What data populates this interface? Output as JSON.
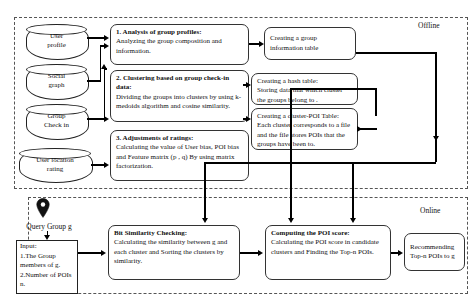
{
  "figure": {
    "offline_label": "Offline",
    "online_label": "Online"
  },
  "data_sources": [
    {
      "id": "user-profile",
      "line1": "User",
      "line2": "profile"
    },
    {
      "id": "social-graph",
      "line1": "Social",
      "line2": "graph"
    },
    {
      "id": "group-checkin",
      "line1": "Group",
      "line2": "Check in"
    },
    {
      "id": "user-location-rating",
      "line1": "User location",
      "line2": "rating"
    }
  ],
  "offline_steps": [
    {
      "id": "analysis",
      "heading": "1. Analysis of group profiles:",
      "body": "Analyzing the group composition and information."
    },
    {
      "id": "clustering",
      "heading": "2. Clustering based on group check-in data:",
      "body": "Dividing the groups into clusters by using k-medoids algorithm and cosine similarity."
    },
    {
      "id": "adjustments",
      "heading": "3. Adjustments of ratings:",
      "body": "Calculating the value of User bias, POI bias and Feature matrix (p , q) By using matrix factorization."
    }
  ],
  "offline_outputs": [
    {
      "id": "group-information-table",
      "line1": "Creating a group",
      "line2": "information table",
      "heading": "",
      "body": ""
    },
    {
      "id": "hash-table",
      "heading": "Creating a hash table:",
      "body": "Storing data that which cluster the groups belong to ."
    },
    {
      "id": "cluster-poi-table",
      "heading": "Creating a cluster-POI Table:",
      "body": "Each cluster corresponds to a file and the file stores POIs that the groups have been to."
    }
  ],
  "query": {
    "pin_icon": "map-pin-icon",
    "label": "Query Group g",
    "input_title": "Input:",
    "input_items": [
      "1.The Group members of g.",
      "2.Number of POIs n."
    ]
  },
  "online_steps": [
    {
      "id": "bit-similarity-checking",
      "heading": "Bit Similarity Checking:",
      "body": "Calculating the similarity  between g and each cluster and Sorting the clusters by similarity."
    },
    {
      "id": "computing-poi-score",
      "heading": "Computing the POI score:",
      "body": "Calculating the POI score in candidate clusters and Finding the Top-n POIs."
    },
    {
      "id": "recommending",
      "line1": "Recommending",
      "line2": "Top-n POIs to g"
    }
  ],
  "colors": {
    "stroke": "#222222",
    "dashed_border": "#555555",
    "background": "#ffffff"
  }
}
